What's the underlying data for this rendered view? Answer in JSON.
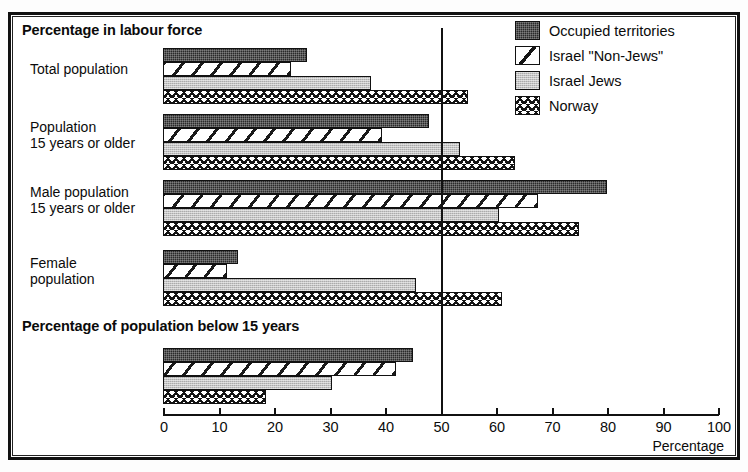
{
  "figure": {
    "section_titles": {
      "labour": "Percentage in labour force",
      "below15": "Percentage of population below 15 years"
    },
    "axis_caption": "Percentage"
  },
  "legend": {
    "position": "top-right",
    "items": [
      {
        "label": "Occupied territories",
        "pattern": "dark-stipple",
        "swatch_class": "pat-dark"
      },
      {
        "label": "Israel \"Non-Jews\"",
        "pattern": "diagonal-stripe",
        "swatch_class": "sw-diag"
      },
      {
        "label": "Israel Jews",
        "pattern": "light-gray-stipple",
        "swatch_class": "pat-gray"
      },
      {
        "label": "Norway",
        "pattern": "herringbone",
        "swatch_class": "pat-zig"
      }
    ]
  },
  "chart_data": {
    "type": "bar",
    "orientation": "horizontal",
    "xlabel": "Percentage",
    "ylabel": "",
    "xlim": [
      0,
      100
    ],
    "xticks": [
      0,
      10,
      20,
      30,
      40,
      50,
      60,
      70,
      80,
      90,
      100
    ],
    "grid": false,
    "reference_line": 50,
    "legend_position": "top-right",
    "panels": [
      {
        "title": "Percentage in labour force",
        "categories": [
          "Total population",
          "Population\n15 years or older",
          "Male population\n15 years or older",
          "Female\npopulation"
        ],
        "series": [
          {
            "name": "Occupied territories",
            "values": [
              26,
              48,
              80,
              13.5
            ]
          },
          {
            "name": "Israel \"Non-Jews\"",
            "values": [
              23,
              39.5,
              67.5,
              11.5
            ]
          },
          {
            "name": "Israel Jews",
            "values": [
              37.5,
              53.5,
              60.5,
              45.5
            ]
          },
          {
            "name": "Norway",
            "values": [
              55,
              63.5,
              75,
              61
            ]
          }
        ]
      },
      {
        "title": "Percentage of population below 15 years",
        "categories": [
          ""
        ],
        "series": [
          {
            "name": "Occupied territories",
            "values": [
              45
            ]
          },
          {
            "name": "Israel \"Non-Jews\"",
            "values": [
              42
            ]
          },
          {
            "name": "Israel Jews",
            "values": [
              30.5
            ]
          },
          {
            "name": "Norway",
            "values": [
              18.5
            ]
          }
        ]
      }
    ]
  },
  "axis": {
    "tick_labels": [
      "0",
      "10",
      "20",
      "30",
      "40",
      "50",
      "60",
      "70",
      "80",
      "90",
      "100"
    ]
  },
  "categories": {
    "total_population": "Total population",
    "pop15": "Population\n15 years or older",
    "male15": "Male population\n15 years or older",
    "female": "Female\npopulation"
  }
}
